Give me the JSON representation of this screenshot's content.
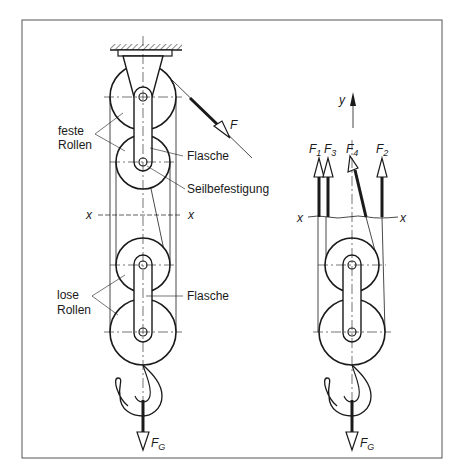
{
  "figure": {
    "left_labels": {
      "fixed_pulleys": [
        "feste",
        "Rollen"
      ],
      "upper_block": "Flasche",
      "rope_attachment": "Seilbefestigung",
      "loose_pulleys": [
        "lose",
        "Rollen"
      ],
      "lower_block": "Flasche",
      "force_pull": "F",
      "force_weight": "F",
      "force_weight_sub": "G",
      "section_left": "x",
      "section_right": "x"
    },
    "right_labels": {
      "axis_y": "y",
      "forces": [
        {
          "name": "F",
          "sub": "1"
        },
        {
          "name": "F",
          "sub": "3"
        },
        {
          "name": "F",
          "sub": "4"
        },
        {
          "name": "F",
          "sub": "2"
        }
      ],
      "force_weight": "F",
      "force_weight_sub": "G",
      "section_left": "x",
      "section_right": "x"
    },
    "colors": {
      "ink": "#1a1a1a",
      "background": "#ffffff",
      "frame": "#555555"
    }
  }
}
